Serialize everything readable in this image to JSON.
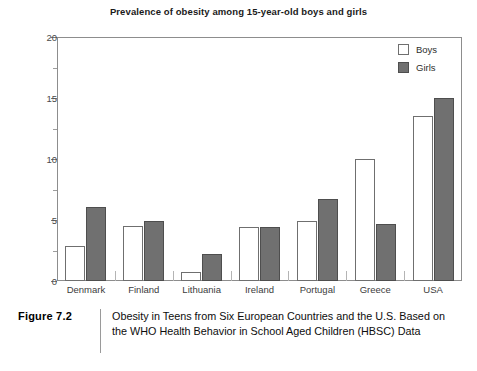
{
  "chart_data": {
    "type": "bar",
    "title": "Prevalence of obesity among 15-year-old boys and girls",
    "xlabel": "",
    "ylabel": "",
    "ylim": [
      0,
      20
    ],
    "yticks": [
      0,
      5,
      10,
      15,
      20
    ],
    "ytick_labels": [
      "0",
      "5",
      "10",
      "15",
      "20"
    ],
    "yminor_step": 2.5,
    "grid": false,
    "legend_position": "top-right",
    "categories": [
      "Denmark",
      "Finland",
      "Lithuania",
      "Ireland",
      "Portugal",
      "Greece",
      "USA"
    ],
    "series": [
      {
        "name": "Boys",
        "color": "#ffffff",
        "edge_color": "#6f6f6f",
        "values": [
          2.9,
          4.5,
          0.7,
          4.4,
          4.9,
          10.0,
          13.5
        ]
      },
      {
        "name": "Girls",
        "color": "#707070",
        "edge_color": "#4e4e4e",
        "values": [
          6.1,
          4.9,
          2.2,
          4.4,
          6.7,
          4.7,
          15.0
        ]
      }
    ]
  },
  "legend": {
    "items": [
      {
        "label": "Boys",
        "swatch": "boys"
      },
      {
        "label": "Girls",
        "swatch": "girls"
      }
    ]
  },
  "caption": {
    "label": "Figure 7.2",
    "text": "Obesity in Teens from Six European Countries and the U.S. Based on the WHO Health Behavior in School Aged Children (HBSC) Data"
  },
  "page_tail": {
    "text": ""
  },
  "colors": {
    "boys_fill": "#ffffff",
    "girls_fill": "#707070",
    "axis": "#8d8d8d",
    "text": "#111111"
  }
}
